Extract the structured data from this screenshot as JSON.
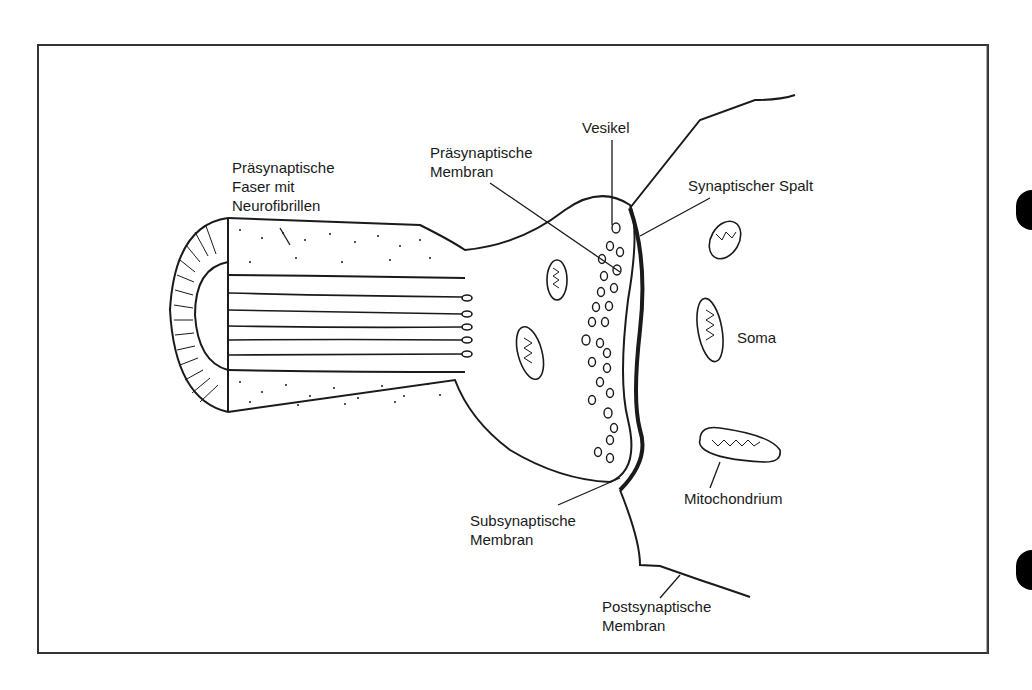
{
  "figure": {
    "colors": {
      "ink": "#1a1a1a",
      "paper": "#ffffff"
    },
    "labels": {
      "presynaptic_fiber": [
        "Präsynaptische",
        "Faser mit",
        "Neurofibrillen"
      ],
      "presynaptic_membrane": [
        "Präsynaptische",
        "Membran"
      ],
      "vesicle": [
        "Vesikel"
      ],
      "synaptic_cleft": [
        "Synaptischer Spalt"
      ],
      "soma": [
        "Soma"
      ],
      "mitochondrium": [
        "Mitochondrium"
      ],
      "subsynaptic_membrane": [
        "Subsynaptische",
        "Membran"
      ],
      "postsynaptic_membrane": [
        "Postsynaptische",
        "Membran"
      ]
    }
  }
}
